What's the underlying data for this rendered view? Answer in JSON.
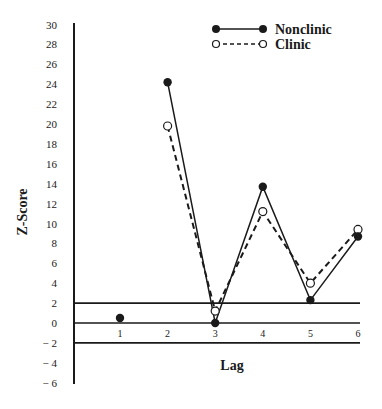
{
  "chart_data": {
    "type": "line",
    "title": "",
    "xlabel": "Lag",
    "ylabel": "Z-Score",
    "x": [
      1,
      2,
      3,
      4,
      5,
      6
    ],
    "y_ticks": [
      30,
      28,
      26,
      24,
      22,
      20,
      18,
      16,
      14,
      12,
      10,
      8,
      6,
      4,
      2,
      0,
      -2,
      -4,
      -6
    ],
    "y_tick_labels": [
      "30",
      "28",
      "26",
      "24",
      "22",
      "20",
      "18",
      "16",
      "14",
      "12",
      "10",
      "8",
      "6",
      "4",
      "2",
      "0",
      "− 2",
      "− 4",
      "− 6"
    ],
    "x_tick_labels": [
      "1",
      "2",
      "3",
      "4",
      "5",
      "6"
    ],
    "ylim": [
      -6,
      30
    ],
    "xlim": [
      0.3,
      6.2
    ],
    "reference_lines": [
      2,
      0,
      -2
    ],
    "grid": false,
    "legend_position": "upper right",
    "series": [
      {
        "name": "Nonclinic",
        "style": "solid",
        "marker": "filled-circle",
        "values": [
          0.5,
          24.2,
          0.0,
          13.7,
          2.3,
          8.7
        ],
        "connected_from_index": 1
      },
      {
        "name": "Clinic",
        "style": "dashed",
        "marker": "open-circle",
        "values": [
          null,
          19.8,
          1.2,
          11.2,
          4.0,
          9.4
        ]
      }
    ]
  },
  "legend": {
    "items": [
      {
        "label": "Nonclinic"
      },
      {
        "label": "Clinic"
      }
    ]
  }
}
